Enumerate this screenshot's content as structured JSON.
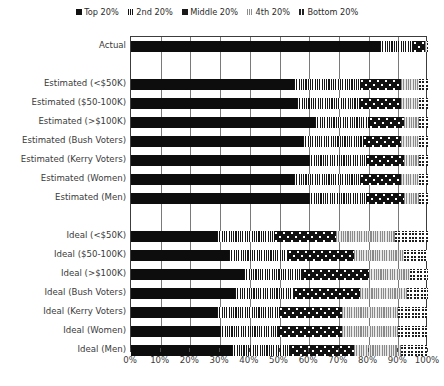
{
  "chart_data": {
    "type": "bar",
    "orientation": "horizontal",
    "stacked": true,
    "title": "",
    "xlabel": "",
    "ylabel": "",
    "xlim": [
      0,
      100
    ],
    "xtick_labels": [
      "0%",
      "10%",
      "20%",
      "30%",
      "40%",
      "50%",
      "60%",
      "70%",
      "80%",
      "90%",
      "100%"
    ],
    "xtick_values": [
      0,
      10,
      20,
      30,
      40,
      50,
      60,
      70,
      80,
      90,
      100
    ],
    "grid": true,
    "legend_position": "top-center",
    "series": [
      {
        "name": "Top 20%",
        "pattern": "solid-black",
        "color": "#0d0d0d"
      },
      {
        "name": "2nd 20%",
        "pattern": "vertical-stripes",
        "color": "#151515"
      },
      {
        "name": "Middle 20%",
        "pattern": "dotted-checker",
        "color": "#111111"
      },
      {
        "name": "4th 20%",
        "pattern": "gray-stripes",
        "color": "#8a8a8a"
      },
      {
        "name": "Bottom 20%",
        "pattern": "checkerboard",
        "color": "#1d1d1d"
      }
    ],
    "categories": [
      "Actual",
      "Estimated (<$50K)",
      "Estimated ($50-100K)",
      "Estimated (>$100K)",
      "Estimated (Bush Voters)",
      "Estimated (Kerry Voters)",
      "Estimated (Women)",
      "Estimated (Men)",
      "Ideal (<$50K)",
      "Ideal ($50-100K)",
      "Ideal (>$100K)",
      "Ideal (Bush Voters)",
      "Ideal (Kerry Voters)",
      "Ideal (Women)",
      "Ideal (Men)"
    ],
    "rows": [
      {
        "label": "Actual",
        "y": 4,
        "values": [
          84.0,
          11.0,
          4.0,
          0.7,
          0.3
        ]
      },
      {
        "label": "Estimated (<$50K)",
        "y": 42,
        "values": [
          55.0,
          22.0,
          14.0,
          6.0,
          3.0
        ]
      },
      {
        "label": "Estimated ($50-100K)",
        "y": 61,
        "values": [
          56.0,
          21.0,
          14.0,
          6.0,
          3.0
        ]
      },
      {
        "label": "Estimated (>$100K)",
        "y": 80,
        "values": [
          62.0,
          18.0,
          12.0,
          5.0,
          3.0
        ]
      },
      {
        "label": "Estimated (Bush Voters)",
        "y": 99,
        "values": [
          58.0,
          20.0,
          13.0,
          6.0,
          3.0
        ]
      },
      {
        "label": "Estimated (Kerry Voters)",
        "y": 118,
        "values": [
          60.0,
          19.0,
          13.0,
          5.0,
          3.0
        ]
      },
      {
        "label": "Estimated (Women)",
        "y": 137,
        "values": [
          55.0,
          22.0,
          14.0,
          6.0,
          3.0
        ]
      },
      {
        "label": "Estimated (Men)",
        "y": 156,
        "values": [
          60.0,
          19.0,
          13.0,
          5.0,
          3.0
        ]
      },
      {
        "label": "Ideal (<$50K)",
        "y": 194,
        "values": [
          29.0,
          19.0,
          21.0,
          20.0,
          11.0
        ]
      },
      {
        "label": "Ideal ($50-100K)",
        "y": 213,
        "values": [
          33.0,
          20.0,
          22.0,
          17.0,
          8.0
        ]
      },
      {
        "label": "Ideal (>$100K)",
        "y": 232,
        "values": [
          38.0,
          20.0,
          22.0,
          14.0,
          6.0
        ]
      },
      {
        "label": "Ideal (Bush Voters)",
        "y": 251,
        "values": [
          35.0,
          20.0,
          22.0,
          16.0,
          7.0
        ]
      },
      {
        "label": "Ideal (Kerry Voters)",
        "y": 270,
        "values": [
          29.0,
          21.0,
          21.0,
          19.0,
          10.0
        ]
      },
      {
        "label": "Ideal (Women)",
        "y": 289,
        "values": [
          30.0,
          20.0,
          21.0,
          19.0,
          10.0
        ]
      },
      {
        "label": "Ideal (Men)",
        "y": 308,
        "values": [
          34.0,
          20.0,
          21.0,
          16.0,
          9.0
        ]
      }
    ]
  },
  "legend": {
    "items": [
      {
        "label": "Top 20%",
        "swatch": "sw-top"
      },
      {
        "label": "2nd 20%",
        "swatch": "sw-2nd"
      },
      {
        "label": "Middle 20%",
        "swatch": "sw-mid"
      },
      {
        "label": "4th 20%",
        "swatch": "sw-4th"
      },
      {
        "label": "Bottom 20%",
        "swatch": "sw-bot"
      }
    ]
  }
}
